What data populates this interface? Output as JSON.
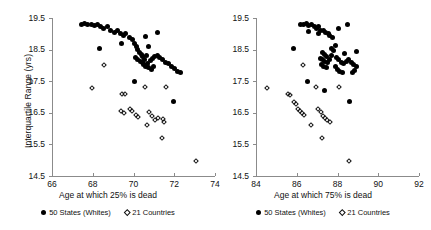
{
  "chart_data": [
    {
      "panel": "left",
      "type": "scatter",
      "title": "",
      "xlabel": "Age at which 25% is dead",
      "ylabel": "Interquartile Range (yrs)",
      "xlim": [
        66,
        74
      ],
      "ylim": [
        14.5,
        19.5
      ],
      "xticks": [
        66,
        68,
        70,
        72,
        74
      ],
      "yticks": [
        14.5,
        15.5,
        16.5,
        17.5,
        18.5,
        19.5
      ],
      "grid": false,
      "legend_position": "bottom",
      "series": [
        {
          "name": "50 States (Whites)",
          "marker": "filled-circle",
          "color": "#000000",
          "points": [
            [
              67.45,
              19.3
            ],
            [
              67.6,
              19.32
            ],
            [
              67.75,
              19.28
            ],
            [
              67.95,
              19.31
            ],
            [
              68.1,
              19.25
            ],
            [
              68.25,
              19.3
            ],
            [
              68.4,
              19.22
            ],
            [
              68.55,
              19.18
            ],
            [
              68.7,
              19.24
            ],
            [
              68.88,
              19.12
            ],
            [
              69.05,
              19.05
            ],
            [
              69.2,
              19.1
            ],
            [
              69.35,
              19.0
            ],
            [
              69.5,
              18.95
            ],
            [
              69.62,
              19.02
            ],
            [
              69.78,
              18.88
            ],
            [
              68.35,
              18.55
            ],
            [
              69.95,
              18.82
            ],
            [
              70.05,
              18.7
            ],
            [
              70.15,
              18.6
            ],
            [
              70.22,
              18.5
            ],
            [
              70.3,
              18.42
            ],
            [
              70.38,
              18.35
            ],
            [
              70.45,
              18.28
            ],
            [
              70.12,
              18.25
            ],
            [
              70.2,
              18.18
            ],
            [
              70.32,
              18.12
            ],
            [
              70.42,
              18.08
            ],
            [
              70.55,
              18.2
            ],
            [
              70.62,
              18.32
            ],
            [
              70.48,
              18.02
            ],
            [
              70.58,
              17.98
            ],
            [
              70.7,
              18.05
            ],
            [
              70.85,
              18.15
            ],
            [
              70.95,
              18.22
            ],
            [
              71.05,
              18.28
            ],
            [
              71.18,
              18.3
            ],
            [
              71.3,
              18.25
            ],
            [
              70.75,
              17.92
            ],
            [
              70.88,
              17.88
            ],
            [
              71.0,
              17.95
            ],
            [
              71.42,
              18.18
            ],
            [
              71.55,
              18.1
            ],
            [
              71.7,
              18.05
            ],
            [
              71.85,
              17.98
            ],
            [
              72.0,
              17.9
            ],
            [
              72.15,
              17.82
            ],
            [
              72.3,
              17.78
            ],
            [
              71.2,
              19.05
            ],
            [
              70.05,
              17.5
            ],
            [
              70.6,
              18.9
            ],
            [
              71.95,
              16.85
            ],
            [
              69.42,
              18.7
            ],
            [
              70.72,
              18.6
            ]
          ]
        },
        {
          "name": "21 Countries",
          "marker": "open-diamond",
          "color": "#111111",
          "points": [
            [
              68.55,
              18.02
            ],
            [
              67.95,
              17.3
            ],
            [
              69.45,
              17.1
            ],
            [
              69.6,
              17.08
            ],
            [
              70.55,
              17.32
            ],
            [
              71.6,
              17.32
            ],
            [
              69.4,
              16.55
            ],
            [
              69.52,
              16.48
            ],
            [
              69.85,
              16.62
            ],
            [
              69.95,
              16.55
            ],
            [
              70.1,
              16.42
            ],
            [
              70.22,
              16.38
            ],
            [
              70.78,
              16.52
            ],
            [
              70.92,
              16.4
            ],
            [
              71.05,
              16.28
            ],
            [
              71.18,
              16.32
            ],
            [
              71.45,
              16.3
            ],
            [
              71.52,
              16.22
            ],
            [
              70.68,
              16.1
            ],
            [
              71.42,
              15.7
            ],
            [
              73.05,
              14.98
            ]
          ]
        }
      ]
    },
    {
      "panel": "right",
      "type": "scatter",
      "title": "",
      "xlabel": "Age at which 75% is dead",
      "ylabel": "Interquartile Range (yrs)",
      "xlim": [
        84,
        92
      ],
      "ylim": [
        14.5,
        19.5
      ],
      "xticks": [
        84,
        86,
        88,
        90,
        92
      ],
      "yticks": [
        14.5,
        15.5,
        16.5,
        17.5,
        18.5,
        19.5
      ],
      "grid": false,
      "legend_position": "bottom",
      "series": [
        {
          "name": "50 States (Whites)",
          "marker": "filled-circle",
          "color": "#000000",
          "points": [
            [
              86.2,
              19.3
            ],
            [
              86.35,
              19.28
            ],
            [
              86.48,
              19.32
            ],
            [
              86.6,
              19.25
            ],
            [
              86.72,
              19.3
            ],
            [
              86.85,
              19.22
            ],
            [
              86.95,
              19.18
            ],
            [
              87.05,
              19.24
            ],
            [
              87.18,
              19.1
            ],
            [
              87.3,
              19.12
            ],
            [
              87.42,
              19.05
            ],
            [
              87.05,
              19.0
            ],
            [
              86.6,
              19.08
            ],
            [
              87.55,
              19.02
            ],
            [
              87.62,
              18.95
            ],
            [
              87.75,
              18.88
            ],
            [
              88.05,
              19.18
            ],
            [
              88.48,
              19.3
            ],
            [
              85.85,
              18.55
            ],
            [
              87.7,
              18.55
            ],
            [
              87.82,
              18.48
            ],
            [
              87.25,
              18.42
            ],
            [
              87.35,
              18.35
            ],
            [
              87.48,
              18.28
            ],
            [
              87.15,
              18.22
            ],
            [
              87.28,
              18.18
            ],
            [
              87.38,
              18.12
            ],
            [
              87.5,
              18.08
            ],
            [
              87.6,
              18.2
            ],
            [
              87.72,
              18.3
            ],
            [
              87.2,
              18.02
            ],
            [
              87.32,
              17.98
            ],
            [
              87.45,
              17.92
            ],
            [
              87.95,
              18.25
            ],
            [
              88.05,
              18.18
            ],
            [
              88.18,
              18.1
            ],
            [
              88.3,
              18.05
            ],
            [
              88.42,
              18.12
            ],
            [
              87.88,
              17.95
            ],
            [
              88.0,
              17.88
            ],
            [
              88.12,
              17.82
            ],
            [
              88.25,
              17.78
            ],
            [
              88.55,
              18.2
            ],
            [
              88.68,
              18.1
            ],
            [
              88.8,
              18.02
            ],
            [
              88.92,
              17.95
            ],
            [
              88.85,
              17.85
            ],
            [
              88.72,
              17.78
            ],
            [
              86.55,
              17.5
            ],
            [
              87.35,
              17.2
            ],
            [
              88.58,
              16.85
            ],
            [
              88.95,
              18.45
            ],
            [
              87.9,
              18.62
            ],
            [
              88.35,
              18.38
            ]
          ]
        },
        {
          "name": "21 Countries",
          "marker": "open-diamond",
          "color": "#111111",
          "points": [
            [
              86.3,
              18.02
            ],
            [
              84.55,
              17.3
            ],
            [
              86.95,
              17.32
            ],
            [
              88.05,
              17.32
            ],
            [
              85.55,
              17.08
            ],
            [
              85.68,
              17.05
            ],
            [
              85.85,
              16.85
            ],
            [
              85.95,
              16.78
            ],
            [
              86.05,
              16.62
            ],
            [
              86.15,
              16.55
            ],
            [
              86.25,
              16.48
            ],
            [
              86.38,
              16.42
            ],
            [
              87.05,
              16.62
            ],
            [
              87.18,
              16.52
            ],
            [
              87.28,
              16.4
            ],
            [
              87.4,
              16.32
            ],
            [
              87.5,
              16.28
            ],
            [
              87.62,
              16.22
            ],
            [
              86.72,
              16.1
            ],
            [
              87.25,
              15.7
            ],
            [
              88.55,
              14.98
            ]
          ]
        }
      ]
    }
  ]
}
